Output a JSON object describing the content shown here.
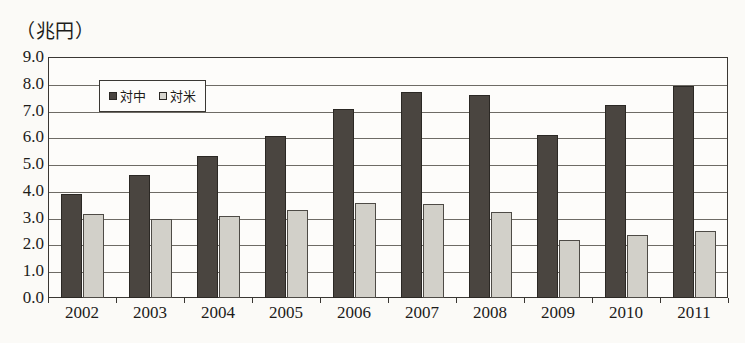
{
  "unit_title": "（兆円）",
  "chart_data": {
    "type": "bar",
    "title": "（兆円）",
    "xlabel": "",
    "ylabel": "兆円",
    "categories": [
      "2002",
      "2003",
      "2004",
      "2005",
      "2006",
      "2007",
      "2008",
      "2009",
      "2010",
      "2011"
    ],
    "series": [
      {
        "name": "対中",
        "color": "#4a4540",
        "values": [
          3.9,
          4.6,
          5.3,
          6.05,
          7.05,
          7.7,
          7.6,
          6.1,
          7.2,
          7.9
        ]
      },
      {
        "name": "対米",
        "color": "#d2d0c9",
        "values": [
          3.15,
          2.95,
          3.05,
          3.3,
          3.55,
          3.5,
          3.2,
          2.15,
          2.35,
          2.5
        ]
      }
    ],
    "ylim": [
      0.0,
      9.0
    ],
    "y_ticks": [
      "9.0",
      "8.0",
      "7.0",
      "6.0",
      "5.0",
      "4.0",
      "3.0",
      "2.0",
      "1.0",
      "0.0"
    ],
    "y_tick_values": [
      9.0,
      8.0,
      7.0,
      6.0,
      5.0,
      4.0,
      3.0,
      2.0,
      1.0,
      0.0
    ],
    "grid": true,
    "legend_position": "top-left-inside"
  },
  "legend": {
    "items": [
      {
        "label": "対中",
        "marker": "square-dark"
      },
      {
        "label": "対米",
        "marker": "square-light"
      }
    ]
  }
}
